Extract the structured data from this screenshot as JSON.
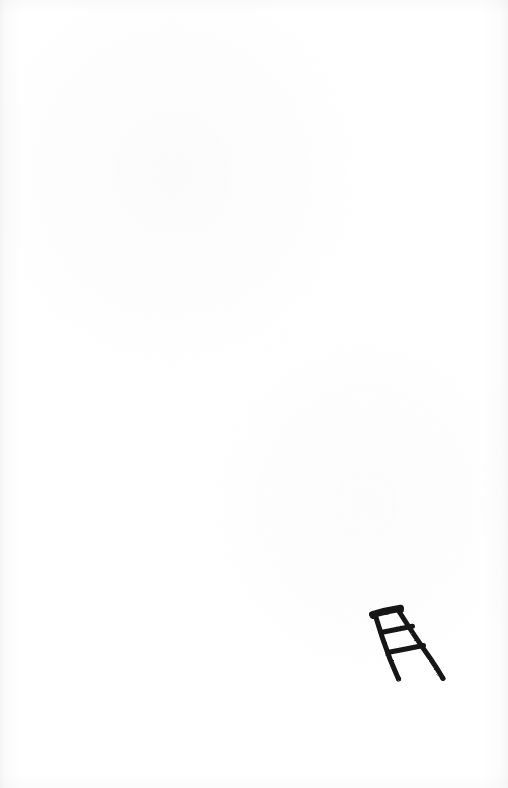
{
  "page": {
    "kind": "scanned-paper-sketch",
    "width": 508,
    "height": 788,
    "background_color": "#ffffff",
    "paper_tone": "#fdfdfd",
    "edge_shadow_color": "#9a9a9a",
    "text_content": "",
    "caption": ""
  },
  "artwork": {
    "subject": "ladder",
    "title": "",
    "description": "Hand-drawn black ink sketch of a tilted step ladder",
    "medium": "ink marker on white paper",
    "ink_color": "#171717",
    "stroke_width": 5,
    "position": "lower-right",
    "bounds": {
      "x": 368,
      "y": 603,
      "width": 80,
      "height": 80
    },
    "parts": [
      {
        "name": "top-cap-rail",
        "label": "Top cap rail",
        "x1": 373,
        "y1": 614,
        "x2": 401,
        "y2": 608,
        "width": 7
      },
      {
        "name": "left-rail",
        "label": "Left rail",
        "x1": 375,
        "y1": 616,
        "x2": 399,
        "y2": 679,
        "width": 5
      },
      {
        "name": "right-rail",
        "label": "Right rail",
        "x1": 398,
        "y1": 611,
        "x2": 443,
        "y2": 678,
        "width": 5
      },
      {
        "name": "rung-upper",
        "label": "Upper rung",
        "x1": 381,
        "y1": 632,
        "x2": 412,
        "y2": 626,
        "width": 5
      },
      {
        "name": "rung-lower",
        "label": "Lower rung",
        "x1": 387,
        "y1": 652,
        "x2": 423,
        "y2": 645,
        "width": 5
      }
    ]
  }
}
